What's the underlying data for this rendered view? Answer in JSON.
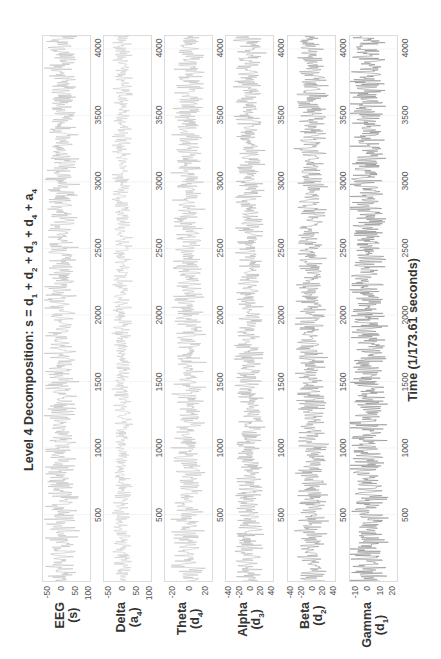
{
  "chart_data": {
    "type": "line",
    "title": "Level 4 Decomposition: s = d1 + d2 + d3 + d4 + a4",
    "xlabel": "Time (1/173.61 seconds)",
    "orientation": "rotated-90-ccw",
    "xlim": [
      0,
      4097
    ],
    "xticks": [
      500,
      1000,
      1500,
      2000,
      2500,
      3000,
      3500,
      4000
    ],
    "grid": true,
    "panels": [
      {
        "name": "EEG",
        "sub": "(s)",
        "ylabel": "EEG (s)",
        "yticks": [
          100,
          50,
          0,
          -50
        ],
        "ylim": [
          -70,
          110
        ],
        "amplitude": 30,
        "color": "#b5b5b5"
      },
      {
        "name": "Delta",
        "sub": "(a4)",
        "ylabel": "Delta (a4)",
        "yticks": [
          100,
          50,
          0,
          -50
        ],
        "ylim": [
          -70,
          110
        ],
        "amplitude": 18,
        "color": "#c4c4c4"
      },
      {
        "name": "Theta",
        "sub": "(d4)",
        "ylabel": "Theta (d4)",
        "yticks": [
          20,
          0,
          -20
        ],
        "ylim": [
          -30,
          30
        ],
        "amplitude": 10,
        "color": "#b8b8b8"
      },
      {
        "name": "Alpha",
        "sub": "(d3)",
        "ylabel": "Alpha (d3)",
        "yticks": [
          40,
          20,
          0,
          -20,
          -40
        ],
        "ylim": [
          -45,
          45
        ],
        "amplitude": 14,
        "color": "#a8a8a8"
      },
      {
        "name": "Beta",
        "sub": "(d2)",
        "ylabel": "Beta (d2)",
        "yticks": [
          40,
          20,
          0,
          -20,
          -40
        ],
        "ylim": [
          -45,
          45
        ],
        "amplitude": 15,
        "color": "#909090"
      },
      {
        "name": "Gamma",
        "sub": "(d1)",
        "ylabel": "Gamma (d1)",
        "yticks": [
          20,
          10,
          0,
          -10
        ],
        "ylim": [
          -15,
          25
        ],
        "amplitude": 8,
        "color": "#7a7a7a"
      }
    ]
  },
  "title": {
    "prefix": "Level 4 Decomposition: s = d",
    "terms": [
      "1",
      "2",
      "3",
      "4"
    ],
    "suffix_var": "a",
    "suffix_sub": "4"
  },
  "xlabel": "Time (1/173.61 seconds)"
}
